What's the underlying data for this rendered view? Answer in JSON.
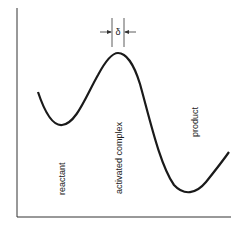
{
  "diagram": {
    "labels": {
      "reactant": "reactant",
      "activated_complex": "activated complex",
      "product": "product",
      "delta": "δ"
    },
    "colors": {
      "line": "#1a1a1a",
      "axis": "#333333",
      "background": "#ffffff"
    }
  }
}
